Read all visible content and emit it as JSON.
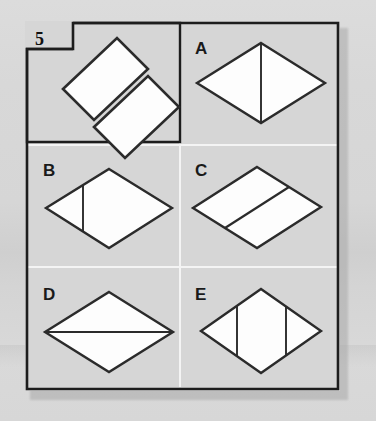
{
  "puzzle": {
    "number": "5",
    "type": "shape-assembly-multiple-choice",
    "prompt_panel": {
      "name": "question-panel",
      "description": "Two congruent separated parallelograms to be joined"
    },
    "options": [
      {
        "key": "A",
        "label": "A",
        "description": "Rhombus divided by a vertical line through the centre"
      },
      {
        "key": "B",
        "label": "B",
        "description": "Rhombus divided by a vertical line left of centre"
      },
      {
        "key": "C",
        "label": "C",
        "description": "Rhombus divided diagonally into two parallelograms"
      },
      {
        "key": "D",
        "label": "D",
        "description": "Rhombus divided by a horizontal line through the centre"
      },
      {
        "key": "E",
        "label": "E",
        "description": "Rhombus divided by two vertical lines"
      }
    ]
  },
  "colors": {
    "page_background": "#d7d7d7",
    "card_border": "#1d1d1d",
    "shape_fill": "#fdfdfd",
    "shape_stroke": "#2b2b2b",
    "divider_light": "#f2f2f2",
    "shadow": "#a9a9a9"
  }
}
